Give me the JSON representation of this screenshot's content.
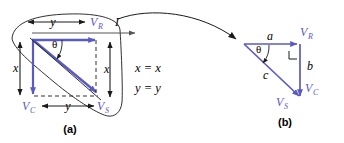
{
  "figure": {
    "background_color": "#ffffff",
    "blue_color": "#5a5ac4",
    "black_color": "#1a1a1a",
    "grey_color": "#555555",
    "panel_a": {
      "caption": "(a)",
      "vector_labels": {
        "v_r": "V",
        "v_r_sub": "R",
        "v_c": "V",
        "v_c_sub": "C",
        "v_s": "V",
        "v_s_sub": "S"
      },
      "dimension_labels": {
        "top_y": "y",
        "bottom_y": "y",
        "left_x": "x",
        "right_x": "x"
      },
      "angle_label": "θ",
      "current_label": "I",
      "identities": [
        "x = x",
        "y = y"
      ]
    },
    "panel_b": {
      "caption": "(b)",
      "vector_labels": {
        "v_r": "V",
        "v_r_sub": "R",
        "v_c": "V",
        "v_c_sub": "C",
        "v_s": "V",
        "v_s_sub": "S"
      },
      "side_labels": {
        "a": "a",
        "b": "b",
        "c": "c"
      },
      "angle_label": "θ",
      "right_angle_marker": "right-angle"
    },
    "callout": {
      "shape": "lasso-oval",
      "arrow": "curved-pointer"
    }
  }
}
